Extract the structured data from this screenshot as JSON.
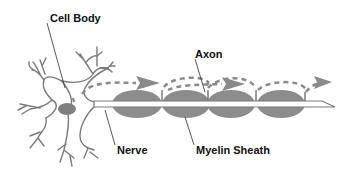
{
  "labels": {
    "cell_body": "Cell Body",
    "axon": "Axon",
    "nerve": "Nerve",
    "myelin_sheath": "Myelin Sheath"
  },
  "colors": {
    "background": "#ffffff",
    "outline": "#7a7a7a",
    "myelin": "#8c8c8c",
    "nucleus": "#7f7f7f",
    "signal": "#8a8a8a",
    "text": "#111111"
  }
}
